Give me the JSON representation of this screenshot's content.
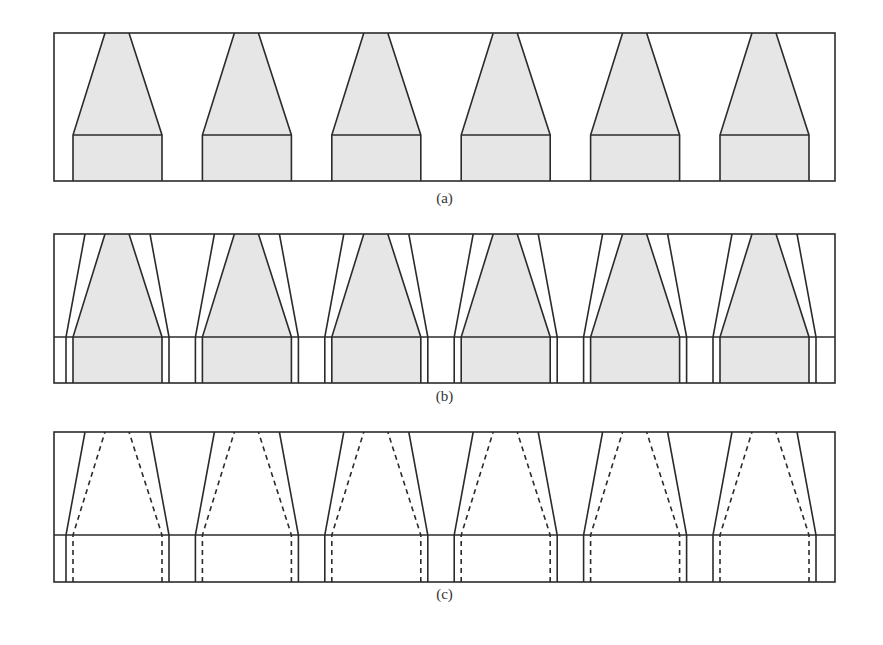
{
  "figure": {
    "panels": [
      {
        "id": "a",
        "label": "(a)",
        "top": 33,
        "bottom": 181,
        "mid": 135,
        "label_y": 190
      },
      {
        "id": "b",
        "label": "(b)",
        "top": 234,
        "bottom": 383,
        "mid": 337,
        "label_y": 388
      },
      {
        "id": "c",
        "label": "(c)",
        "top": 432,
        "bottom": 582,
        "mid": 535,
        "label_y": 586
      }
    ],
    "frame": {
      "left": 54,
      "right": 835
    },
    "shape_count": 6,
    "pitch": 129.4,
    "first_shape": {
      "inner_top_left": 105,
      "inner_top_right": 129,
      "inner_base_left": 73,
      "inner_base_right": 162,
      "outer_top_left": 85,
      "outer_top_right": 150,
      "outer_base_left": 66,
      "outer_base_right": 169
    },
    "colors": {
      "stroke": "#2b2b2b",
      "fill": "#e6e6e6"
    }
  }
}
